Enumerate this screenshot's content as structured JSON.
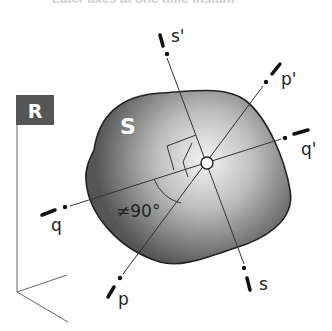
{
  "caption": "Later axes at one time instant",
  "frame": {
    "label": "R",
    "box_color": "#555555"
  },
  "body": {
    "label": "S"
  },
  "axes": [
    {
      "name": "s-axis",
      "start_label": "s'",
      "end_label": "s"
    },
    {
      "name": "p-axis",
      "start_label": "p'",
      "end_label": "p"
    },
    {
      "name": "q-axis",
      "start_label": "q'",
      "end_label": "q"
    }
  ],
  "angle_label": "≠90°",
  "colors": {
    "line": "#333333",
    "body_dark": "#5a5a5a",
    "body_light": "#f2f2f2"
  }
}
